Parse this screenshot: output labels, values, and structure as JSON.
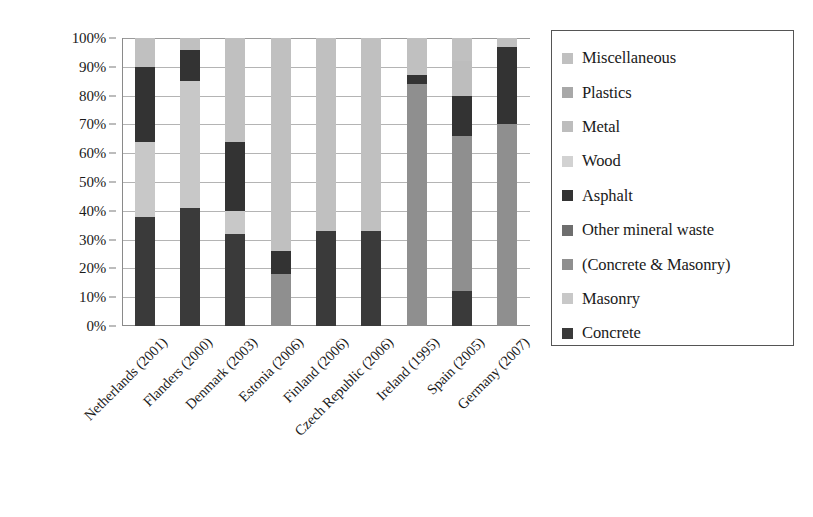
{
  "chart_data": {
    "type": "bar",
    "stacked": true,
    "title": "",
    "xlabel": "",
    "ylabel": "",
    "ylim": [
      0,
      100
    ],
    "y_tick_labels": [
      "0%",
      "10%",
      "20%",
      "30%",
      "40%",
      "50%",
      "60%",
      "70%",
      "80%",
      "90%",
      "100%"
    ],
    "y_tick_values": [
      0,
      10,
      20,
      30,
      40,
      50,
      60,
      70,
      80,
      90,
      100
    ],
    "grid": true,
    "legend_position": "right",
    "categories": [
      "Netherlands (2001)",
      "Flanders (2000)",
      "Denmark (2003)",
      "Estonia (2006)",
      "Finland (2006)",
      "Czech Republic (2006)",
      "Ireland (1995)",
      "Spain (2005)",
      "Germany (2007)"
    ],
    "series": [
      {
        "name": "Concrete",
        "color": "#3a3a3a",
        "values": [
          38,
          41,
          32,
          0,
          33,
          33,
          0,
          12,
          0
        ]
      },
      {
        "name": "Masonry",
        "color": "#c8c8c8",
        "values": [
          26,
          0,
          8,
          0,
          0,
          0,
          0,
          0,
          0
        ]
      },
      {
        "name": "(Concrete & Masonry)",
        "color": "#8f8f8f",
        "values": [
          0,
          0,
          0,
          18,
          0,
          0,
          84,
          54,
          70
        ]
      },
      {
        "name": "Other mineral waste",
        "color": "#6e6e6e",
        "values": [
          0,
          0,
          0,
          0,
          0,
          0,
          0,
          0,
          0
        ]
      },
      {
        "name": "Asphalt",
        "color": "#333333",
        "values": [
          26,
          44,
          24,
          8,
          0,
          0,
          3,
          14,
          27
        ]
      },
      {
        "name": "Wood",
        "color": "#d2d2d2",
        "values": [
          0,
          11,
          0,
          0,
          0,
          0,
          0,
          0,
          0
        ]
      },
      {
        "name": "Metal",
        "color": "#bdbdbd",
        "values": [
          0,
          0,
          0,
          0,
          0,
          0,
          0,
          12,
          0
        ]
      },
      {
        "name": "Plastics",
        "color": "#a8a8a8",
        "values": [
          0,
          0,
          0,
          0,
          0,
          0,
          0,
          0,
          0
        ]
      },
      {
        "name": "Miscellaneous",
        "color": "#c0c0c0",
        "values": [
          10,
          4,
          36,
          74,
          67,
          67,
          13,
          8,
          3
        ]
      }
    ],
    "bar_stacks": [
      {
        "category": "Netherlands (2001)",
        "segments": [
          {
            "series": "Concrete",
            "from": 0,
            "to": 38,
            "color": "#3a3a3a"
          },
          {
            "series": "Masonry",
            "from": 38,
            "to": 64,
            "color": "#c8c8c8"
          },
          {
            "series": "Asphalt",
            "from": 64,
            "to": 90,
            "color": "#333333"
          },
          {
            "series": "Miscellaneous",
            "from": 90,
            "to": 100,
            "color": "#c0c0c0"
          }
        ]
      },
      {
        "category": "Flanders (2000)",
        "segments": [
          {
            "series": "Concrete",
            "from": 0,
            "to": 41,
            "color": "#3a3a3a"
          },
          {
            "series": "Masonry",
            "from": 41,
            "to": 85,
            "color": "#c8c8c8"
          },
          {
            "series": "Asphalt",
            "from": 85,
            "to": 96,
            "color": "#333333"
          },
          {
            "series": "Miscellaneous",
            "from": 96,
            "to": 100,
            "color": "#c0c0c0"
          }
        ]
      },
      {
        "category": "Denmark (2003)",
        "segments": [
          {
            "series": "Concrete",
            "from": 0,
            "to": 32,
            "color": "#3a3a3a"
          },
          {
            "series": "Masonry",
            "from": 32,
            "to": 40,
            "color": "#c8c8c8"
          },
          {
            "series": "Asphalt",
            "from": 40,
            "to": 64,
            "color": "#333333"
          },
          {
            "series": "Miscellaneous",
            "from": 64,
            "to": 100,
            "color": "#c0c0c0"
          }
        ]
      },
      {
        "category": "Estonia (2006)",
        "segments": [
          {
            "series": "(Concrete & Masonry)",
            "from": 0,
            "to": 18,
            "color": "#8f8f8f"
          },
          {
            "series": "Asphalt",
            "from": 18,
            "to": 26,
            "color": "#333333"
          },
          {
            "series": "Miscellaneous",
            "from": 26,
            "to": 100,
            "color": "#c0c0c0"
          }
        ]
      },
      {
        "category": "Finland (2006)",
        "segments": [
          {
            "series": "Concrete",
            "from": 0,
            "to": 33,
            "color": "#3a3a3a"
          },
          {
            "series": "Miscellaneous",
            "from": 33,
            "to": 100,
            "color": "#c0c0c0"
          }
        ]
      },
      {
        "category": "Czech Republic (2006)",
        "segments": [
          {
            "series": "Concrete",
            "from": 0,
            "to": 33,
            "color": "#3a3a3a"
          },
          {
            "series": "Miscellaneous",
            "from": 33,
            "to": 100,
            "color": "#c0c0c0"
          }
        ]
      },
      {
        "category": "Ireland (1995)",
        "segments": [
          {
            "series": "(Concrete & Masonry)",
            "from": 0,
            "to": 84,
            "color": "#8f8f8f"
          },
          {
            "series": "Asphalt",
            "from": 84,
            "to": 87,
            "color": "#333333"
          },
          {
            "series": "Miscellaneous",
            "from": 87,
            "to": 100,
            "color": "#c0c0c0"
          }
        ]
      },
      {
        "category": "Spain (2005)",
        "segments": [
          {
            "series": "Concrete",
            "from": 0,
            "to": 12,
            "color": "#3a3a3a"
          },
          {
            "series": "(Concrete & Masonry)",
            "from": 12,
            "to": 66,
            "color": "#8f8f8f"
          },
          {
            "series": "Asphalt",
            "from": 66,
            "to": 80,
            "color": "#333333"
          },
          {
            "series": "Metal",
            "from": 80,
            "to": 92,
            "color": "#bdbdbd"
          },
          {
            "series": "Miscellaneous",
            "from": 92,
            "to": 100,
            "color": "#c0c0c0"
          }
        ]
      },
      {
        "category": "Germany (2007)",
        "segments": [
          {
            "series": "(Concrete & Masonry)",
            "from": 0,
            "to": 70,
            "color": "#8f8f8f"
          },
          {
            "series": "Asphalt",
            "from": 70,
            "to": 97,
            "color": "#333333"
          },
          {
            "series": "Miscellaneous",
            "from": 97,
            "to": 100,
            "color": "#c0c0c0"
          }
        ]
      }
    ],
    "legend_entries": [
      {
        "label": "Miscellaneous",
        "color": "#c0c0c0"
      },
      {
        "label": "Plastics",
        "color": "#a8a8a8"
      },
      {
        "label": "Metal",
        "color": "#bdbdbd"
      },
      {
        "label": "Wood",
        "color": "#d2d2d2"
      },
      {
        "label": "Asphalt",
        "color": "#333333"
      },
      {
        "label": "Other mineral waste",
        "color": "#6e6e6e"
      },
      {
        "label": "(Concrete & Masonry)",
        "color": "#8f8f8f"
      },
      {
        "label": "Masonry",
        "color": "#c8c8c8"
      },
      {
        "label": "Concrete",
        "color": "#3a3a3a"
      }
    ]
  }
}
